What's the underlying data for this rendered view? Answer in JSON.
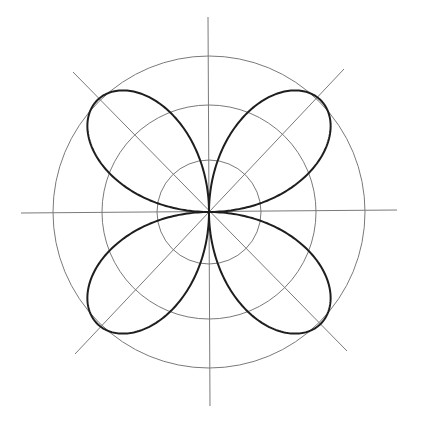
{
  "diagram": {
    "title": "",
    "type": "polar-rose",
    "equation_form": "r = a·sin(2θ)",
    "petals": 4,
    "petal_angles_deg": [
      45,
      135,
      225,
      315
    ],
    "center": {
      "x": 209,
      "y": 212
    },
    "amplitude_px": 158,
    "grid": {
      "circle_radii_px": [
        52,
        107,
        156
      ],
      "axes": [
        {
          "name": "vertical",
          "x1": 208,
          "y1": 17,
          "x2": 210,
          "y2": 406
        },
        {
          "name": "horizontal",
          "x1": 21,
          "y1": 213,
          "x2": 397,
          "y2": 210
        },
        {
          "name": "diagonal-main",
          "x1": 73,
          "y1": 72,
          "x2": 347,
          "y2": 351
        },
        {
          "name": "diagonal-anti",
          "x1": 75,
          "y1": 354,
          "x2": 344,
          "y2": 69
        }
      ]
    },
    "colors": {
      "background": "#ffffff",
      "grid": "#7a7a7a",
      "curve": "#1e1e1e"
    },
    "stroke_widths": {
      "grid": 1,
      "curve": 2
    }
  }
}
